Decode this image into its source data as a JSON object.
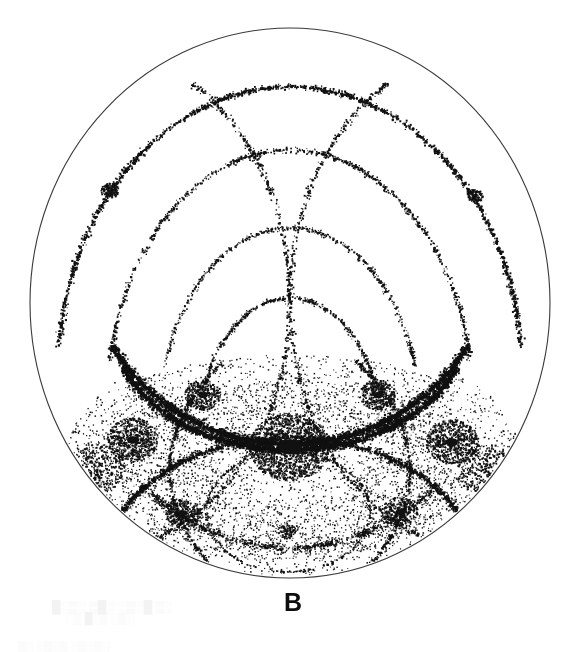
{
  "figure": {
    "panel_label": "B",
    "panel_label_x": 293,
    "panel_label_y": 590,
    "panel_label_size": 25,
    "background_color": "#ffffff",
    "ink_color": "#0d0d0d",
    "outline_color": "#3a3a3a",
    "width": 576,
    "height": 649
  },
  "projection": {
    "type": "stereographic-dot-pattern",
    "center_x": 290,
    "center_y": 303,
    "radius_x": 260,
    "radius_y": 275,
    "outline_width": 1.1,
    "dot_color": "#111111",
    "dot_min_size": 0.9,
    "dot_max_size": 2.2,
    "random_seed": 20240517
  },
  "chart_data": {
    "type": "scatter",
    "title": "B",
    "xlabel": "",
    "ylabel": "",
    "xlim": [
      -1,
      1
    ],
    "ylim": [
      -1,
      1
    ],
    "grid": false,
    "legend": false,
    "bands": [
      {
        "name": "outer-band-upper",
        "cx": 290,
        "cy": 372,
        "rx": 232,
        "ry": 285,
        "a0": 185,
        "a1": 355,
        "count": 1700,
        "spread": 3.4,
        "weight": 1.0
      },
      {
        "name": "second-band-upper",
        "cx": 290,
        "cy": 405,
        "rx": 183,
        "ry": 255,
        "a0": 190,
        "a1": 350,
        "count": 950,
        "spread": 3.2,
        "weight": 0.75
      },
      {
        "name": "third-band-upper",
        "cx": 290,
        "cy": 420,
        "rx": 130,
        "ry": 192,
        "a0": 196,
        "a1": 344,
        "count": 620,
        "spread": 3.0,
        "weight": 0.62
      },
      {
        "name": "inner-band-upper",
        "cx": 290,
        "cy": 438,
        "rx": 92,
        "ry": 140,
        "a0": 200,
        "a1": 340,
        "count": 520,
        "spread": 2.8,
        "weight": 0.7
      },
      {
        "name": "left-limb-arc",
        "cx": 95,
        "cy": 300,
        "rx": 195,
        "ry": 250,
        "a0": 300,
        "a1": 80,
        "count": 700,
        "spread": 3.6,
        "weight": 0.8
      },
      {
        "name": "right-limb-arc",
        "cx": 485,
        "cy": 300,
        "rx": 195,
        "ry": 250,
        "a0": 100,
        "a1": 240,
        "count": 700,
        "spread": 3.6,
        "weight": 0.8
      },
      {
        "name": "main-equator-band",
        "cx": 290,
        "cy": 248,
        "rx": 205,
        "ry": 196,
        "a0": 30,
        "a1": 150,
        "count": 2600,
        "spread": 4.6,
        "weight": 1.35
      },
      {
        "name": "lower-lens-upper-edge",
        "cx": 290,
        "cy": 318,
        "rx": 180,
        "ry": 132,
        "a0": 22,
        "a1": 158,
        "count": 2300,
        "spread": 4.2,
        "weight": 1.5
      },
      {
        "name": "lower-lens-lower-edge",
        "cx": 290,
        "cy": 568,
        "rx": 186,
        "ry": 130,
        "a0": 203,
        "a1": 337,
        "count": 1500,
        "spread": 4.0,
        "weight": 1.0
      },
      {
        "name": "small-bottom-ellipse",
        "cx": 288,
        "cy": 512,
        "rx": 82,
        "ry": 60,
        "a0": 0,
        "a1": 360,
        "count": 520,
        "spread": 2.0,
        "weight": 0.55
      },
      {
        "name": "bottom-chord-band",
        "cx": 290,
        "cy": 300,
        "rx": 222,
        "ry": 248,
        "a0": 48,
        "a1": 132,
        "count": 900,
        "spread": 5.5,
        "weight": 0.7
      },
      {
        "name": "left-lower-diagonal",
        "cx": 470,
        "cy": 470,
        "rx": 300,
        "ry": 190,
        "a0": 150,
        "a1": 215,
        "count": 520,
        "spread": 3.2,
        "weight": 0.75
      },
      {
        "name": "right-lower-diagonal",
        "cx": 110,
        "cy": 470,
        "rx": 300,
        "ry": 190,
        "a0": 325,
        "a1": 30,
        "count": 520,
        "spread": 3.2,
        "weight": 0.75
      }
    ],
    "nodes": [
      {
        "name": "node-upper-left-star",
        "x": 110,
        "y": 191,
        "r": 9,
        "count": 150,
        "core": 3.0
      },
      {
        "name": "node-upper-right-star",
        "x": 475,
        "y": 196,
        "r": 8,
        "count": 120,
        "core": 2.7
      },
      {
        "name": "node-left-zone-axis",
        "x": 133,
        "y": 440,
        "r": 26,
        "count": 620,
        "core": 6.0
      },
      {
        "name": "node-right-zone-axis",
        "x": 452,
        "y": 442,
        "r": 26,
        "count": 620,
        "core": 6.0
      },
      {
        "name": "node-center-dense-core",
        "x": 290,
        "y": 447,
        "r": 40,
        "count": 1500,
        "core": 12.0
      },
      {
        "name": "node-left-upper-vertex",
        "x": 203,
        "y": 395,
        "r": 18,
        "count": 340,
        "core": 5.0
      },
      {
        "name": "node-right-upper-vertex",
        "x": 378,
        "y": 395,
        "r": 18,
        "count": 340,
        "core": 5.0
      },
      {
        "name": "node-left-lower-vertex",
        "x": 183,
        "y": 513,
        "r": 18,
        "count": 300,
        "core": 4.5
      },
      {
        "name": "node-right-lower-vertex",
        "x": 400,
        "y": 512,
        "r": 18,
        "count": 300,
        "core": 4.5
      },
      {
        "name": "node-left-rim-cluster",
        "x": 96,
        "y": 468,
        "r": 30,
        "count": 430,
        "core": 0
      },
      {
        "name": "node-right-rim-cluster",
        "x": 487,
        "y": 470,
        "r": 30,
        "count": 430,
        "core": 0
      },
      {
        "name": "node-bottom-convergence",
        "x": 287,
        "y": 531,
        "r": 9,
        "count": 90,
        "core": 2.0
      }
    ],
    "spokes": [
      {
        "name": "spoke-bottom-left-up",
        "x1": 287,
        "y1": 531,
        "x2": 212,
        "y2": 500,
        "count": 24
      },
      {
        "name": "spoke-bottom-right-up",
        "x1": 287,
        "y1": 531,
        "x2": 356,
        "y2": 497,
        "count": 24
      },
      {
        "name": "spoke-bottom-left-down",
        "x1": 287,
        "y1": 531,
        "x2": 205,
        "y2": 551,
        "count": 20
      },
      {
        "name": "spoke-bottom-right-down",
        "x1": 287,
        "y1": 531,
        "x2": 370,
        "y2": 548,
        "count": 20
      },
      {
        "name": "spoke-left-axis-out",
        "x1": 133,
        "y1": 440,
        "x2": 58,
        "y2": 430,
        "count": 26
      },
      {
        "name": "spoke-right-axis-out",
        "x1": 452,
        "y1": 442,
        "x2": 527,
        "y2": 432,
        "count": 26
      }
    ],
    "haze": [
      {
        "name": "haze-lower-center",
        "x": 290,
        "y": 470,
        "rx": 175,
        "ry": 90,
        "count": 2200
      },
      {
        "name": "haze-left-flank",
        "x": 145,
        "y": 470,
        "rx": 80,
        "ry": 95,
        "count": 900
      },
      {
        "name": "haze-right-flank",
        "x": 440,
        "y": 470,
        "rx": 80,
        "ry": 95,
        "count": 900
      },
      {
        "name": "haze-bottom-arc",
        "x": 290,
        "y": 545,
        "rx": 170,
        "ry": 45,
        "count": 700
      },
      {
        "name": "haze-mid-upper",
        "x": 290,
        "y": 400,
        "rx": 165,
        "ry": 45,
        "count": 800
      }
    ]
  },
  "ghost_text": {
    "note": "faint scan bleed-through marks visible at bottom edge",
    "lines": [
      {
        "text": "█░▒░ ▒█░ ░▒░█ ▒░",
        "x": 52,
        "y": 600,
        "size": 12
      },
      {
        "text": "░▒ █░▒ ░▒░",
        "x": 66,
        "y": 612,
        "size": 11
      },
      {
        "text": "▒░ ░▒░▒ ░▒░▒░",
        "x": 18,
        "y": 640,
        "size": 11
      }
    ]
  }
}
